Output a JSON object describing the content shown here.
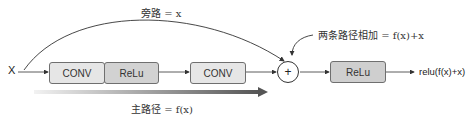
{
  "diagram": {
    "input_label": "X",
    "skip_path_label": "旁路 = x",
    "main_path_label": "主路径 = f(x)",
    "sum_label": "两条路径相加 = f(x)+x",
    "output_label": "relu(f(x)+x)",
    "sum_symbol": "+",
    "blocks": [
      {
        "id": "conv1",
        "label": "CONV",
        "fill": "#e6e6e6"
      },
      {
        "id": "relu1",
        "label": "ReLu",
        "fill": "#d2d2d2"
      },
      {
        "id": "conv2",
        "label": "CONV",
        "fill": "#e6e6e6"
      },
      {
        "id": "relu2",
        "label": "ReLu",
        "fill": "#cfcfcf"
      }
    ],
    "colors": {
      "line": "#333333",
      "box_border": "#6f6f6f",
      "gradient_start": "#f2f2f2",
      "gradient_end": "#555555"
    }
  }
}
